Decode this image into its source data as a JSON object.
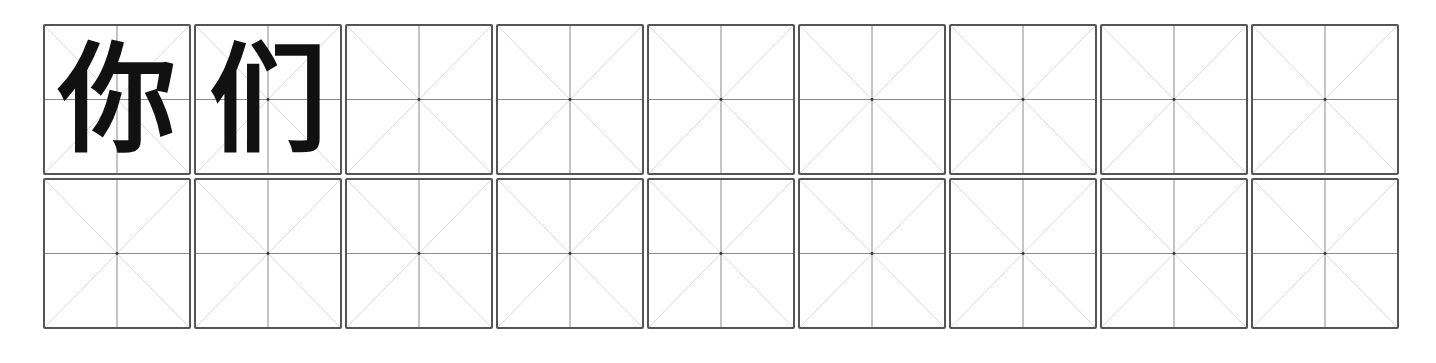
{
  "worksheet": {
    "type": "mi-zi-ge practice grid",
    "rows": 2,
    "columns": 9,
    "colors": {
      "border": "#555555",
      "guide_lines": "#9a9a9a",
      "character": "#111111"
    },
    "cells": [
      [
        "你",
        "们",
        "",
        "",
        "",
        "",
        "",
        "",
        ""
      ],
      [
        "",
        "",
        "",
        "",
        "",
        "",
        "",
        "",
        ""
      ]
    ]
  }
}
